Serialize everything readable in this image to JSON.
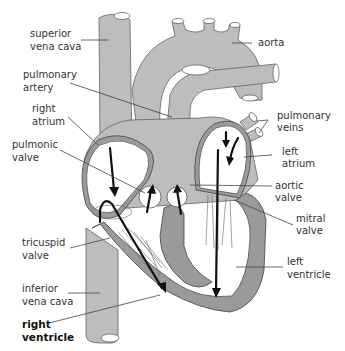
{
  "diagram": {
    "colors": {
      "vessel": "#bdbdbd",
      "wall": "#9a9a9a",
      "outline": "#555555",
      "flow_arrow": "#111111",
      "label_text": "#333333",
      "background": "#ffffff"
    },
    "labels": {
      "superior_vena_cava": {
        "line1": "superior",
        "line2": "vena cava"
      },
      "aorta": {
        "line1": "aorta"
      },
      "pulmonary_artery": {
        "line1": "pulmonary",
        "line2": "artery"
      },
      "pulmonary_veins": {
        "line1": "pulmonary",
        "line2": "veins"
      },
      "right_atrium": {
        "line1": "right",
        "line2": "atrium"
      },
      "left_atrium": {
        "line1": "left",
        "line2": "atrium"
      },
      "pulmonic_valve": {
        "line1": "pulmonic",
        "line2": "valve"
      },
      "aortic_valve": {
        "line1": "aortic",
        "line2": "valve"
      },
      "mitral_valve": {
        "line1": "mitral",
        "line2": "valve"
      },
      "tricuspid_valve": {
        "line1": "tricuspid",
        "line2": "valve"
      },
      "left_ventricle": {
        "line1": "left",
        "line2": "ventricle"
      },
      "inferior_vena_cava": {
        "line1": "inferior",
        "line2": "vena cava"
      },
      "right_ventricle": {
        "line1": "right",
        "line2": "ventricle"
      }
    }
  }
}
